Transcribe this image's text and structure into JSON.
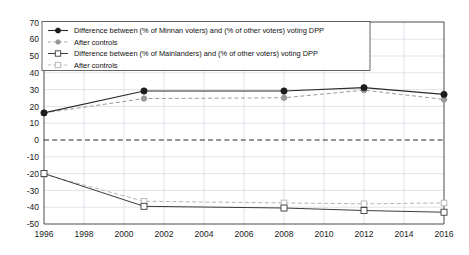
{
  "chart_data": {
    "type": "line",
    "title": "",
    "subtitle": "",
    "xlabel": "",
    "ylabel": "",
    "xlim": [
      1996,
      2016
    ],
    "ylim": [
      -50,
      70
    ],
    "grid": true,
    "legend_position": "top-left",
    "x_ticks": [
      1996,
      1998,
      2000,
      2002,
      2004,
      2006,
      2008,
      2010,
      2012,
      2014,
      2016
    ],
    "y_ticks": [
      -50,
      -40,
      -30,
      -20,
      -10,
      0,
      10,
      20,
      30,
      40,
      50,
      60,
      70
    ],
    "zero_reference_line": 0,
    "x": [
      1996,
      2001,
      2008,
      2012,
      2016
    ],
    "series": [
      {
        "name": "Difference between (% of Minnan voters) and (% of other voters) voting DPP",
        "style": "solid-filled-circle",
        "color": "#2a2a2a",
        "values": [
          16,
          29,
          29,
          31,
          27
        ]
      },
      {
        "name": "After controls",
        "style": "dashed-grey-circle",
        "color": "#9a9a9a",
        "values": [
          16,
          24.5,
          25,
          29.5,
          24
        ]
      },
      {
        "name": "Difference between (% of Mainlanders) and (% of other voters) voting DPP",
        "style": "solid-open-square",
        "color": "#3a3a3a",
        "values": [
          -20,
          -39.5,
          -40.5,
          -42,
          -43
        ]
      },
      {
        "name": "After controls",
        "style": "dashed-light-open-square",
        "color": "#b4b4b4",
        "values": [
          -20.5,
          -36.5,
          -37.5,
          -38,
          -37.5
        ]
      }
    ],
    "legend": [
      {
        "label": "Difference between (% of Minnan voters) and (% of other voters) voting DPP",
        "marker": "filled-circle-solid-line"
      },
      {
        "label": "After controls",
        "marker": "grey-circle-dashed-line"
      },
      {
        "label": "Difference between (% of Mainlanders) and (% of other voters) voting DPP",
        "marker": "open-square-solid-line"
      },
      {
        "label": "After controls",
        "marker": "open-square-dashed-light-line"
      }
    ]
  }
}
